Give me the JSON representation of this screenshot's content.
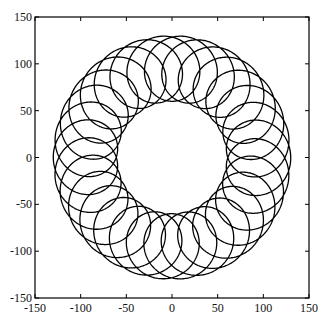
{
  "chart_data": {
    "type": "line",
    "title": "",
    "xlabel": "",
    "ylabel": "",
    "xlim": [
      -150,
      150
    ],
    "ylim": [
      -150,
      150
    ],
    "grid": false,
    "legend": null,
    "x_ticks": [
      -150,
      -100,
      -50,
      0,
      50,
      100,
      150
    ],
    "y_ticks": [
      -150,
      -100,
      -50,
      0,
      50,
      100,
      150
    ],
    "x_tick_labels": [
      "-150",
      "-100",
      "-50",
      "0",
      "50",
      "100",
      "150"
    ],
    "y_tick_labels": [
      "-150",
      "-100",
      "-50",
      "0",
      "50",
      "100",
      "150"
    ],
    "series": [
      {
        "name": "looped curve",
        "description": "Trochoid-like closed-ish curve: circle of radius ~95 with ~30 small inward loops of radius ~35; outer envelope ~130, inner loop tips ~60",
        "color": "#000000",
        "params": {
          "R": 95,
          "r": 35,
          "loops": 30,
          "drift": 0.035,
          "turns": 1.0
        }
      }
    ]
  }
}
